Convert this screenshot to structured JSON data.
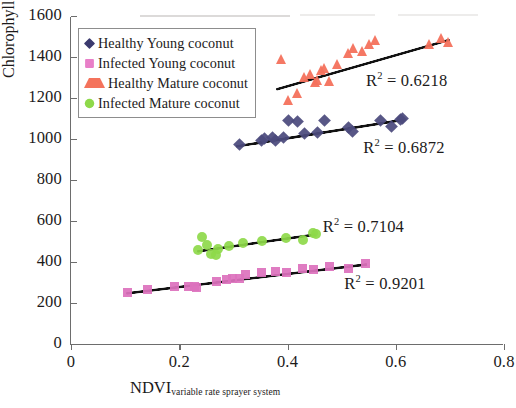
{
  "chart_data": {
    "type": "scatter",
    "title": "",
    "subtitle": "",
    "xlabel": "NDVI",
    "xlabel_subscript": "variable rate sprayer system",
    "ylabel": "Chlorophyll content (µmol m",
    "ylabel_superscript": "-2",
    "ylabel_suffix": ")",
    "xlim": [
      0,
      0.8
    ],
    "ylim": [
      0,
      1600
    ],
    "xticks": [
      0,
      0.2,
      0.4,
      0.6,
      0.8
    ],
    "xtick_labels": [
      "0",
      "0.2",
      "0.4",
      "0.6",
      "0.8"
    ],
    "yticks": [
      0,
      200,
      400,
      600,
      800,
      1000,
      1200,
      1400,
      1600
    ],
    "ytick_labels": [
      "0",
      "200",
      "400",
      "600",
      "800",
      "1000",
      "1200",
      "1400",
      "1600"
    ],
    "grid": false,
    "legend_position": "upper-left",
    "series": [
      {
        "name": "Healthy Young coconut",
        "marker": "diamond",
        "color": "#4b4a7d",
        "legend_color": "#3b3a6e",
        "r_squared": "0.6872",
        "r_squared_label": "R² = 0.6872",
        "trendline": {
          "x0": 0.305,
          "y0": 975,
          "x1": 0.615,
          "y1": 1105
        },
        "points": [
          [
            0.312,
            978
          ],
          [
            0.352,
            1000
          ],
          [
            0.358,
            1008
          ],
          [
            0.372,
            1012
          ],
          [
            0.378,
            1000
          ],
          [
            0.392,
            1012
          ],
          [
            0.402,
            1093
          ],
          [
            0.418,
            1092
          ],
          [
            0.432,
            1030
          ],
          [
            0.455,
            1038
          ],
          [
            0.468,
            1093
          ],
          [
            0.512,
            1062
          ],
          [
            0.52,
            1043
          ],
          [
            0.572,
            1095
          ],
          [
            0.592,
            1068
          ],
          [
            0.608,
            1100
          ],
          [
            0.613,
            1104
          ]
        ]
      },
      {
        "name": "Infected Young coconut",
        "marker": "square",
        "color": "#dd72bd",
        "legend_color": "#e87fc8",
        "r_squared": "0.9201",
        "r_squared_label": "R² = 0.9201",
        "trendline": {
          "x0": 0.102,
          "y0": 258,
          "x1": 0.548,
          "y1": 400
        },
        "points": [
          [
            0.104,
            258
          ],
          [
            0.142,
            272
          ],
          [
            0.192,
            283
          ],
          [
            0.218,
            287
          ],
          [
            0.228,
            286
          ],
          [
            0.232,
            282
          ],
          [
            0.268,
            308
          ],
          [
            0.288,
            320
          ],
          [
            0.298,
            322
          ],
          [
            0.312,
            326
          ],
          [
            0.322,
            343
          ],
          [
            0.352,
            352
          ],
          [
            0.378,
            358
          ],
          [
            0.398,
            352
          ],
          [
            0.428,
            372
          ],
          [
            0.448,
            370
          ],
          [
            0.478,
            382
          ],
          [
            0.512,
            372
          ],
          [
            0.545,
            400
          ]
        ]
      },
      {
        "name": "Healthy Mature coconut",
        "marker": "triangle",
        "color": "#f4715c",
        "legend_color": "#f4735c",
        "r_squared": "0.6218",
        "r_squared_label": "R² = 0.6218",
        "trendline": {
          "x0": 0.378,
          "y0": 1255,
          "x1": 0.7,
          "y1": 1498
        },
        "points": [
          [
            0.388,
            1395
          ],
          [
            0.402,
            1195
          ],
          [
            0.418,
            1228
          ],
          [
            0.432,
            1308
          ],
          [
            0.442,
            1320
          ],
          [
            0.452,
            1285
          ],
          [
            0.455,
            1295
          ],
          [
            0.462,
            1342
          ],
          [
            0.468,
            1350
          ],
          [
            0.478,
            1290
          ],
          [
            0.492,
            1372
          ],
          [
            0.512,
            1425
          ],
          [
            0.522,
            1450
          ],
          [
            0.538,
            1432
          ],
          [
            0.552,
            1468
          ],
          [
            0.562,
            1490
          ],
          [
            0.662,
            1470
          ],
          [
            0.685,
            1498
          ],
          [
            0.698,
            1480
          ]
        ]
      },
      {
        "name": "Infected Mature coconut",
        "marker": "circle",
        "color": "#8ed94a",
        "legend_color": "#8ed94a",
        "r_squared": "0.7104",
        "r_squared_label": "R² = 0.7104",
        "trendline": {
          "x0": 0.232,
          "y0": 462,
          "x1": 0.452,
          "y1": 545
        },
        "points": [
          [
            0.234,
            462
          ],
          [
            0.242,
            528
          ],
          [
            0.252,
            487
          ],
          [
            0.258,
            445
          ],
          [
            0.268,
            438
          ],
          [
            0.272,
            470
          ],
          [
            0.292,
            482
          ],
          [
            0.318,
            498
          ],
          [
            0.352,
            505
          ],
          [
            0.398,
            520
          ],
          [
            0.428,
            512
          ],
          [
            0.448,
            546
          ],
          [
            0.452,
            540
          ]
        ]
      }
    ],
    "annotations": [
      {
        "text": "R² = 0.6218",
        "x": 0.545,
        "y": 1290
      },
      {
        "text": "R² = 0.6872",
        "x": 0.54,
        "y": 960
      },
      {
        "text": "R² = 0.7104",
        "x": 0.465,
        "y": 575
      },
      {
        "text": "R² = 0.9201",
        "x": 0.505,
        "y": 300
      }
    ]
  },
  "legend": {
    "items": [
      {
        "label": "Healthy Young coconut"
      },
      {
        "label": "Infected Young coconut"
      },
      {
        "label": "Healthy Mature coconut"
      },
      {
        "label": "Infected Mature coconut"
      }
    ]
  }
}
